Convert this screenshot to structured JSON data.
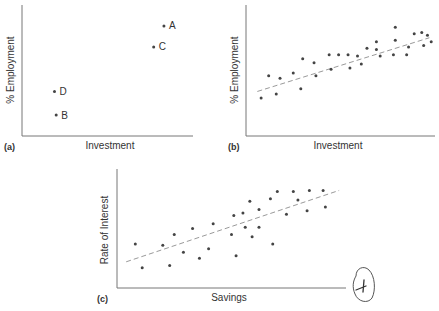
{
  "chart_data": [
    {
      "id": "a",
      "type": "scatter",
      "panel_label": "(a)",
      "title": "",
      "xlabel": "Investment",
      "ylabel": "% Employment",
      "grid": false,
      "trendline": false,
      "points": [
        {
          "label": "A",
          "x": 0.83,
          "y": 0.84
        },
        {
          "label": "C",
          "x": 0.77,
          "y": 0.68
        },
        {
          "label": "D",
          "x": 0.19,
          "y": 0.34
        },
        {
          "label": "B",
          "x": 0.2,
          "y": 0.16
        }
      ]
    },
    {
      "id": "b",
      "type": "scatter",
      "panel_label": "(b)",
      "title": "",
      "xlabel": "Investment",
      "ylabel": "% Employment",
      "grid": false,
      "trendline": true,
      "trend_line": {
        "x1": 0.06,
        "y1": 0.34,
        "x2": 0.97,
        "y2": 0.75
      },
      "points": [
        {
          "x": 0.08,
          "y": 0.29
        },
        {
          "x": 0.12,
          "y": 0.46
        },
        {
          "x": 0.16,
          "y": 0.32
        },
        {
          "x": 0.18,
          "y": 0.44
        },
        {
          "x": 0.25,
          "y": 0.48
        },
        {
          "x": 0.29,
          "y": 0.36
        },
        {
          "x": 0.3,
          "y": 0.59
        },
        {
          "x": 0.36,
          "y": 0.56
        },
        {
          "x": 0.37,
          "y": 0.46
        },
        {
          "x": 0.44,
          "y": 0.62
        },
        {
          "x": 0.45,
          "y": 0.51
        },
        {
          "x": 0.49,
          "y": 0.62
        },
        {
          "x": 0.54,
          "y": 0.62
        },
        {
          "x": 0.55,
          "y": 0.52
        },
        {
          "x": 0.59,
          "y": 0.61
        },
        {
          "x": 0.61,
          "y": 0.55
        },
        {
          "x": 0.64,
          "y": 0.67
        },
        {
          "x": 0.69,
          "y": 0.66
        },
        {
          "x": 0.69,
          "y": 0.72
        },
        {
          "x": 0.71,
          "y": 0.61
        },
        {
          "x": 0.78,
          "y": 0.62
        },
        {
          "x": 0.79,
          "y": 0.83
        },
        {
          "x": 0.79,
          "y": 0.73
        },
        {
          "x": 0.85,
          "y": 0.62
        },
        {
          "x": 0.86,
          "y": 0.68
        },
        {
          "x": 0.89,
          "y": 0.78
        },
        {
          "x": 0.93,
          "y": 0.79
        },
        {
          "x": 0.94,
          "y": 0.69
        },
        {
          "x": 0.96,
          "y": 0.77
        },
        {
          "x": 0.98,
          "y": 0.72
        }
      ]
    },
    {
      "id": "c",
      "type": "scatter",
      "panel_label": "(c)",
      "title": "",
      "xlabel": "Savings",
      "ylabel": "Rate of Interest",
      "grid": false,
      "trendline": true,
      "trend_line": {
        "x1": 0.04,
        "y1": 0.22,
        "x2": 0.97,
        "y2": 0.82
      },
      "points": [
        {
          "x": 0.08,
          "y": 0.37
        },
        {
          "x": 0.11,
          "y": 0.17
        },
        {
          "x": 0.2,
          "y": 0.36
        },
        {
          "x": 0.23,
          "y": 0.19
        },
        {
          "x": 0.25,
          "y": 0.45
        },
        {
          "x": 0.29,
          "y": 0.3
        },
        {
          "x": 0.33,
          "y": 0.5
        },
        {
          "x": 0.36,
          "y": 0.25
        },
        {
          "x": 0.4,
          "y": 0.33
        },
        {
          "x": 0.42,
          "y": 0.54
        },
        {
          "x": 0.5,
          "y": 0.45
        },
        {
          "x": 0.51,
          "y": 0.61
        },
        {
          "x": 0.52,
          "y": 0.27
        },
        {
          "x": 0.55,
          "y": 0.63
        },
        {
          "x": 0.56,
          "y": 0.51
        },
        {
          "x": 0.58,
          "y": 0.73
        },
        {
          "x": 0.59,
          "y": 0.43
        },
        {
          "x": 0.62,
          "y": 0.51
        },
        {
          "x": 0.62,
          "y": 0.66
        },
        {
          "x": 0.67,
          "y": 0.75
        },
        {
          "x": 0.68,
          "y": 0.37
        },
        {
          "x": 0.7,
          "y": 0.81
        },
        {
          "x": 0.74,
          "y": 0.62
        },
        {
          "x": 0.77,
          "y": 0.81
        },
        {
          "x": 0.79,
          "y": 0.74
        },
        {
          "x": 0.83,
          "y": 0.65
        },
        {
          "x": 0.84,
          "y": 0.82
        },
        {
          "x": 0.9,
          "y": 0.82
        },
        {
          "x": 0.91,
          "y": 0.68
        }
      ]
    }
  ],
  "figure": {
    "panels": [
      {
        "panel_label": "(a)",
        "xlabel": "Investment",
        "ylabel": "% Employment"
      },
      {
        "panel_label": "(b)",
        "xlabel": "Investment",
        "ylabel": "% Employment"
      },
      {
        "panel_label": "(c)",
        "xlabel": "Savings",
        "ylabel": "Rate of Interest"
      }
    ],
    "handwritten_page_number": "4",
    "colors": {
      "axis": "#777777",
      "dot": "#444444",
      "trend": "#9a9a9a",
      "text": "#333333"
    }
  }
}
